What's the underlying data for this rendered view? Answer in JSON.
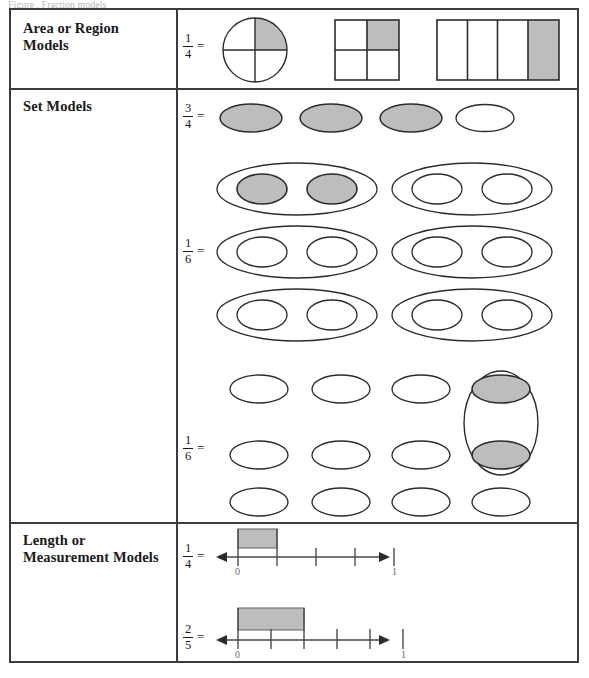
{
  "caption": {
    "partial_text": "Figure  .   Fraction models"
  },
  "colors": {
    "shade": "#bdbdbd",
    "stroke": "#2b2b2b",
    "border": "#3c3c3c",
    "text": "#1a1a1a",
    "axis": "#4a4a4a"
  },
  "table": {
    "rows": [
      {
        "label_lines": [
          "Area or Region",
          "Models"
        ],
        "label": "Area or Region Models",
        "examples": [
          {
            "fraction": {
              "numerator": "1",
              "denominator": "4"
            },
            "equals": "=",
            "models": [
              {
                "name": "circle-fourths",
                "type": "circle",
                "parts": 4,
                "shaded": 1,
                "shaded_index": 0
              },
              {
                "name": "square-fourths",
                "type": "square-grid",
                "rows": 2,
                "cols": 2,
                "parts": 4,
                "shaded": 1,
                "shaded_index": 1
              },
              {
                "name": "rectangle-fourths",
                "type": "rect-strips",
                "parts": 4,
                "shaded": 1,
                "shaded_index": 3
              }
            ]
          }
        ]
      },
      {
        "label_lines": [
          "Set Models"
        ],
        "label": "Set Models",
        "examples": [
          {
            "fraction": {
              "numerator": "3",
              "denominator": "4"
            },
            "equals": "=",
            "models": [
              {
                "name": "set-of-four-ovals",
                "type": "oval-row",
                "total": 4,
                "shaded": 3,
                "shaded_indices": [
                  0,
                  1,
                  2
                ]
              }
            ]
          },
          {
            "fraction": {
              "numerator": "1",
              "denominator": "6"
            },
            "equals": "=",
            "models": [
              {
                "name": "grouped-ovals-horizontal",
                "type": "oval-groups",
                "group_rows": 3,
                "group_cols": 2,
                "ovals_per_group": 2,
                "total_groups": 6,
                "total_ovals": 12,
                "shaded_group_index": 0,
                "shaded_ovals": 2
              }
            ]
          },
          {
            "fraction": {
              "numerator": "1",
              "denominator": "6"
            },
            "equals": "=",
            "models": [
              {
                "name": "oval-grid-with-vertical-group",
                "type": "oval-grid",
                "rows": 3,
                "cols": 4,
                "total_ovals": 12,
                "group_outline": "vertical-oval-column-4-rows-1-2",
                "shaded_ovals": 2,
                "shaded_cells": [
                  [
                    0,
                    3
                  ],
                  [
                    1,
                    3
                  ]
                ]
              }
            ]
          }
        ]
      },
      {
        "label_lines": [
          "Length or",
          "Measurement Models"
        ],
        "label": "Length or Measurement Models",
        "examples": [
          {
            "fraction": {
              "numerator": "1",
              "denominator": "4"
            },
            "equals": "=",
            "models": [
              {
                "name": "number-line-fourths",
                "type": "number-line",
                "divisions": 4,
                "shaded_units": 1,
                "start_label": "0",
                "end_label": "1",
                "tick_count": 5,
                "arrows": "both"
              }
            ]
          },
          {
            "fraction": {
              "numerator": "2",
              "denominator": "5"
            },
            "equals": "=",
            "models": [
              {
                "name": "number-line-fifths",
                "type": "number-line",
                "divisions": 5,
                "shaded_units": 2,
                "start_label": "0",
                "end_label": "1",
                "tick_count": 6,
                "arrows": "both"
              }
            ]
          }
        ]
      }
    ]
  }
}
